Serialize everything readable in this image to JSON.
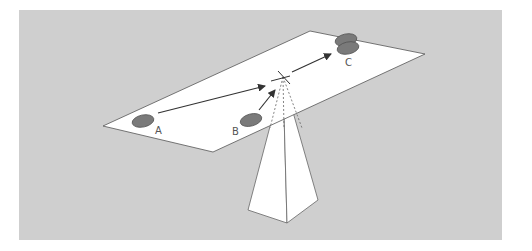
{
  "colors": {
    "background": "#ffffff",
    "panel": "#cfcfcf",
    "plane": "#ffffff",
    "outline": "#555555",
    "object_fill": "#7a7a7a",
    "arrow": "#333333"
  },
  "labels": {
    "a": "A",
    "b": "B",
    "c": "C"
  },
  "diagram": {
    "objects": [
      "A",
      "B",
      "C"
    ],
    "pivot_marker": "x"
  }
}
